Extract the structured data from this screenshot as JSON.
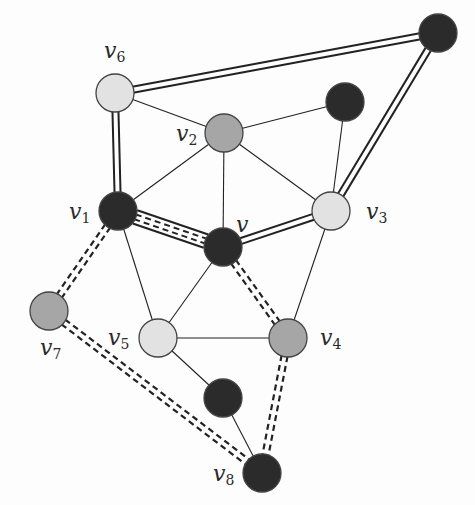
{
  "diagram": {
    "type": "graph",
    "width": 475,
    "height": 505,
    "colors": {
      "black": "#2b2b2b",
      "gray": "#a6a6a6",
      "light": "#e2e2e2",
      "stroke": "#444444",
      "edge": "#222222",
      "background": "#fdfdfd"
    },
    "node_radius": 19,
    "nodes": [
      {
        "id": "t",
        "x": 438,
        "y": 33,
        "fill": "black",
        "label": "",
        "sub": ""
      },
      {
        "id": "v6",
        "x": 115,
        "y": 93,
        "fill": "light",
        "label": "v",
        "sub": "6",
        "lx": 104,
        "ly": 58
      },
      {
        "id": "u",
        "x": 345,
        "y": 102,
        "fill": "black",
        "label": "",
        "sub": ""
      },
      {
        "id": "v2",
        "x": 224,
        "y": 133,
        "fill": "gray",
        "label": "v",
        "sub": "2",
        "lx": 176,
        "ly": 141
      },
      {
        "id": "v1",
        "x": 118,
        "y": 211,
        "fill": "black",
        "label": "v",
        "sub": "1",
        "lx": 69,
        "ly": 219
      },
      {
        "id": "v3",
        "x": 331,
        "y": 211,
        "fill": "light",
        "label": "v",
        "sub": "3",
        "lx": 366,
        "ly": 219
      },
      {
        "id": "v",
        "x": 223,
        "y": 247,
        "fill": "black",
        "label": "v",
        "sub": "",
        "lx": 236,
        "ly": 232
      },
      {
        "id": "v7",
        "x": 49,
        "y": 311,
        "fill": "gray",
        "label": "v",
        "sub": "7",
        "lx": 40,
        "ly": 355
      },
      {
        "id": "v5",
        "x": 158,
        "y": 338,
        "fill": "light",
        "label": "v",
        "sub": "5",
        "lx": 108,
        "ly": 345
      },
      {
        "id": "v4",
        "x": 288,
        "y": 338,
        "fill": "gray",
        "label": "v",
        "sub": "4",
        "lx": 320,
        "ly": 345
      },
      {
        "id": "w",
        "x": 223,
        "y": 398,
        "fill": "black",
        "label": "",
        "sub": ""
      },
      {
        "id": "v8",
        "x": 262,
        "y": 473,
        "fill": "black",
        "label": "v",
        "sub": "8",
        "lx": 213,
        "ly": 481
      }
    ],
    "edges": [
      {
        "from": "v6",
        "to": "t",
        "style": "double"
      },
      {
        "from": "t",
        "to": "v3",
        "style": "double"
      },
      {
        "from": "v6",
        "to": "v1",
        "style": "double"
      },
      {
        "from": "v",
        "to": "v3",
        "style": "double"
      },
      {
        "from": "v1",
        "to": "v",
        "style": "double-dashed-inner"
      },
      {
        "from": "v1",
        "to": "v7",
        "style": "dashed-double"
      },
      {
        "from": "v7",
        "to": "v8",
        "style": "dashed-double"
      },
      {
        "from": "v",
        "to": "v4",
        "style": "dashed-double"
      },
      {
        "from": "v4",
        "to": "v8",
        "style": "dashed-double"
      },
      {
        "from": "v6",
        "to": "v2",
        "style": "thin"
      },
      {
        "from": "v2",
        "to": "u",
        "style": "thin"
      },
      {
        "from": "u",
        "to": "v3",
        "style": "thin"
      },
      {
        "from": "v2",
        "to": "v1",
        "style": "thin"
      },
      {
        "from": "v2",
        "to": "v",
        "style": "thin"
      },
      {
        "from": "v2",
        "to": "v3",
        "style": "thin"
      },
      {
        "from": "v1",
        "to": "v5",
        "style": "thin"
      },
      {
        "from": "v",
        "to": "v5",
        "style": "thin"
      },
      {
        "from": "v3",
        "to": "v4",
        "style": "thin"
      },
      {
        "from": "v5",
        "to": "v4",
        "style": "thin"
      },
      {
        "from": "v5",
        "to": "w",
        "style": "thin"
      },
      {
        "from": "w",
        "to": "v8",
        "style": "thin"
      }
    ]
  }
}
